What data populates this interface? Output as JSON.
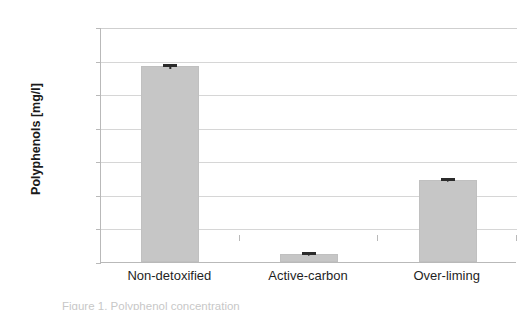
{
  "chart_data": {
    "type": "bar",
    "title": "",
    "xlabel": "",
    "ylabel": "Polyphenols [mg/l]",
    "categories": [
      "Non-detoxified",
      "Active-carbon",
      "Over-liming"
    ],
    "values": [
      1170,
      45,
      490
    ],
    "errors": [
      15,
      6,
      10
    ],
    "ylim": [
      0,
      1400
    ],
    "ytick_labels": [
      "0",
      "200",
      "400",
      "600",
      "800",
      "1000",
      "1200",
      "1400"
    ],
    "ytick_values": [
      0,
      200,
      400,
      600,
      800,
      1000,
      1200,
      1400
    ],
    "grid": true,
    "legend": "none",
    "bar_color": "#c6c6c6",
    "error_color": "#2b2b2b",
    "grid_color": "#d6d6d6",
    "axis_color": "#b9b9b9",
    "series": [
      {
        "name": "Polyphenols",
        "values": [
          1170,
          45,
          490
        ]
      }
    ]
  },
  "caption": {
    "text": "Figure 1. Polyphenol concentration"
  }
}
